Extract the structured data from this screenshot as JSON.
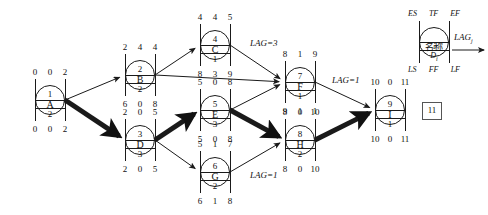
{
  "legend": {
    "top_labels": [
      "ES",
      "TF",
      "EF"
    ],
    "bottom_labels": [
      "LS",
      "FF",
      "LF"
    ],
    "index_label": "i",
    "name_label": "名称",
    "duration_label": "D",
    "duration_sub": "i",
    "lag_label": "LAG",
    "lag_sub": "j"
  },
  "nodes": [
    {
      "id": "A",
      "name": "A",
      "index": "1",
      "duration": "2",
      "es": "0",
      "tf": "0",
      "ef": "2",
      "ls": "0",
      "ff": "0",
      "lf": "2",
      "x": 50,
      "y": 100
    },
    {
      "id": "B",
      "name": "B",
      "index": "2",
      "duration": "2",
      "es": "2",
      "tf": "4",
      "ef": "4",
      "ls": "6",
      "ff": "0",
      "lf": "8",
      "x": 140,
      "y": 75
    },
    {
      "id": "D",
      "name": "D",
      "index": "3",
      "duration": "3",
      "es": "2",
      "tf": "0",
      "ef": "5",
      "ls": "2",
      "ff": "0",
      "lf": "5",
      "x": 140,
      "y": 140
    },
    {
      "id": "C",
      "name": "C",
      "index": "4",
      "duration": "1",
      "es": "4",
      "tf": "4",
      "ef": "5",
      "ls": "8",
      "ff": "3",
      "lf": "9",
      "x": 215,
      "y": 45
    },
    {
      "id": "E",
      "name": "E",
      "index": "5",
      "duration": "3",
      "es": "5",
      "tf": "0",
      "ef": "8",
      "ls": "5",
      "ff": "0",
      "lf": "8",
      "x": 215,
      "y": 110
    },
    {
      "id": "G",
      "name": "G",
      "index": "6",
      "duration": "2",
      "es": "5",
      "tf": "1",
      "ef": "7",
      "ls": "6",
      "ff": "1",
      "lf": "8",
      "x": 215,
      "y": 172
    },
    {
      "id": "F",
      "name": "F",
      "index": "7",
      "duration": "1",
      "es": "8",
      "tf": "1",
      "ef": "9",
      "ls": "9",
      "ff": "1",
      "lf": "1",
      "x": 300,
      "y": 82
    },
    {
      "id": "H",
      "name": "H",
      "index": "8",
      "duration": "2",
      "es": "8",
      "tf": "0",
      "ef": "10",
      "ls": "8",
      "ff": "0",
      "lf": "10",
      "x": 300,
      "y": 140
    },
    {
      "id": "I",
      "name": "I",
      "index": "9",
      "duration": "1",
      "es": "10",
      "tf": "0",
      "ef": "11",
      "ls": "10",
      "ff": "0",
      "lf": "11",
      "x": 390,
      "y": 110
    }
  ],
  "lag_labels": [
    {
      "text": "LAG=3",
      "x": 250,
      "y": 38,
      "edge": "C-F"
    },
    {
      "text": "LAG=1",
      "x": 332,
      "y": 75,
      "edge": "F-I"
    },
    {
      "text": "LAG=1",
      "x": 250,
      "y": 170,
      "edge": "G-H"
    }
  ],
  "finish_box": {
    "value": "11",
    "x": 422,
    "y": 102
  },
  "edges": [
    {
      "from": "A",
      "to": "B",
      "critical": false
    },
    {
      "from": "A",
      "to": "D",
      "critical": true
    },
    {
      "from": "B",
      "to": "C",
      "critical": false
    },
    {
      "from": "B",
      "to": "F",
      "critical": false
    },
    {
      "from": "D",
      "to": "E",
      "critical": true
    },
    {
      "from": "D",
      "to": "G",
      "critical": false
    },
    {
      "from": "C",
      "to": "F",
      "critical": false
    },
    {
      "from": "E",
      "to": "F",
      "critical": false
    },
    {
      "from": "E",
      "to": "H",
      "critical": true
    },
    {
      "from": "G",
      "to": "H",
      "critical": false
    },
    {
      "from": "F",
      "to": "I",
      "critical": false
    },
    {
      "from": "H",
      "to": "I",
      "critical": true
    }
  ],
  "colors": {
    "stroke": "#1a1a1a",
    "background": "#ffffff",
    "box_border": "#555555"
  }
}
